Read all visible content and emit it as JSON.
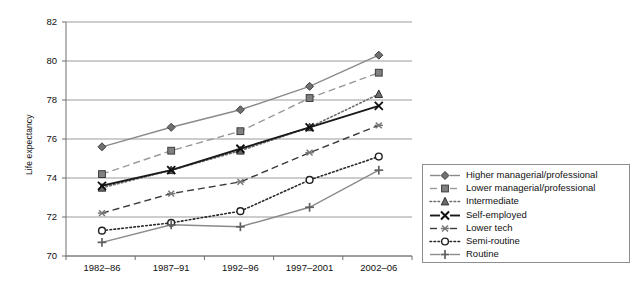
{
  "chart_data": {
    "type": "line",
    "title": "",
    "xlabel": "",
    "ylabel": "Life expectancy",
    "categories": [
      "1982–86",
      "1987–91",
      "1992–96",
      "1997–2001",
      "2002–06"
    ],
    "ylim": [
      70,
      82
    ],
    "ytick_values": [
      70,
      72,
      74,
      76,
      78,
      80,
      82
    ],
    "ytick_labels": [
      "70",
      "72",
      "74",
      "76",
      "78",
      "80",
      "82"
    ],
    "grid": "horizontal",
    "legend_position": "right-outside",
    "series": [
      {
        "name": "Higher managerial/professional",
        "values": [
          75.6,
          76.6,
          77.5,
          78.7,
          80.3
        ],
        "marker": "diamond",
        "line_style": "solid",
        "color": "#8a8a8a"
      },
      {
        "name": "Lower managerial/professional",
        "values": [
          74.2,
          75.4,
          76.4,
          78.1,
          79.4
        ],
        "marker": "square",
        "line_style": "dashed",
        "color": "#9a9a9a"
      },
      {
        "name": "Intermediate",
        "values": [
          73.5,
          74.4,
          75.4,
          76.6,
          78.3
        ],
        "marker": "triangle",
        "line_style": "dotted",
        "color": "#6e6e6e"
      },
      {
        "name": "Self-employed",
        "values": [
          73.6,
          74.4,
          75.5,
          76.6,
          77.7
        ],
        "marker": "x",
        "line_style": "solid",
        "color": "#1a1a1a"
      },
      {
        "name": "Lower tech",
        "values": [
          72.2,
          73.2,
          73.8,
          75.3,
          76.7
        ],
        "marker": "asterisk",
        "line_style": "dashed",
        "color": "#3a3a3a"
      },
      {
        "name": "Semi-routine",
        "values": [
          71.3,
          71.7,
          72.3,
          73.9,
          75.1
        ],
        "marker": "circle-open",
        "line_style": "dotted",
        "color": "#2a2a2a"
      },
      {
        "name": "Routine",
        "values": [
          70.7,
          71.6,
          71.5,
          72.5,
          74.4
        ],
        "marker": "plus",
        "line_style": "solid",
        "color": "#8a8a8a"
      }
    ]
  },
  "legend": {
    "entries": [
      "Higher managerial/professional",
      "Lower managerial/professional",
      "Intermediate",
      "Self-employed",
      "Lower tech",
      "Semi-routine",
      "Routine"
    ]
  },
  "colors": {
    "axis": "#6f6f6f",
    "grid": "#9b9b9b",
    "text": "#111111",
    "legend_border": "#8d8d8d",
    "background": "#ffffff"
  }
}
